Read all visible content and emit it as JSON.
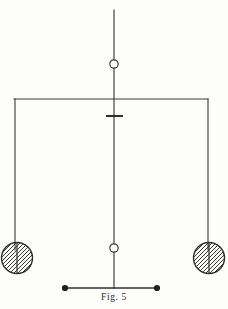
{
  "figure": {
    "caption": "Fig. 5",
    "caption_x": 114,
    "caption_y": 296,
    "canvas": {
      "width": 228,
      "height": 309
    },
    "background_color": "#fdfdfb",
    "ink_color": "#3a3a3a",
    "line_width": 1.1,
    "parts": {
      "suspension_rod": {
        "label": "suspension-rod",
        "x": 114,
        "y_top": 10,
        "y_bottom": 288
      },
      "upper_pivot_ring": {
        "label": "upper-pivot-ring",
        "cx": 114,
        "cy": 64,
        "r": 4.2,
        "fill": "#fdfdfb"
      },
      "lower_pivot_ring": {
        "label": "lower-pivot-ring",
        "cx": 114,
        "cy": 248,
        "r": 4.2,
        "fill": "#fdfdfb"
      },
      "crossbar": {
        "label": "upper-crossbar",
        "y": 99,
        "x_left": 14,
        "x_right": 208
      },
      "left_suspension_wire": {
        "label": "left-suspension-wire",
        "x": 15,
        "y_top": 99,
        "y_bottom": 250
      },
      "right_suspension_wire": {
        "label": "right-suspension-wire",
        "x": 208,
        "y_top": 99,
        "y_bottom": 250
      },
      "stop_tee": {
        "label": "stop-tee-mark",
        "y": 116,
        "x_left": 106,
        "x_right": 123
      },
      "left_bob": {
        "label": "left-hatched-bob",
        "cx": 17,
        "cy": 258,
        "r": 15.5,
        "hatch_direction": "forward-slash",
        "hatch_spacing": 4
      },
      "right_bob": {
        "label": "right-hatched-bob",
        "cx": 209,
        "cy": 258,
        "r": 15.5,
        "hatch_direction": "forward-slash",
        "hatch_spacing": 4
      },
      "bottom_beam": {
        "label": "bottom-beam",
        "y": 288,
        "x_left": 65,
        "x_right": 157
      },
      "left_end_node": {
        "label": "left-end-node",
        "cx": 65,
        "cy": 288,
        "r": 3.1,
        "fill": "#1f1f1f"
      },
      "right_end_node": {
        "label": "right-end-node",
        "cx": 157,
        "cy": 288,
        "r": 3.1,
        "fill": "#1f1f1f"
      }
    }
  }
}
